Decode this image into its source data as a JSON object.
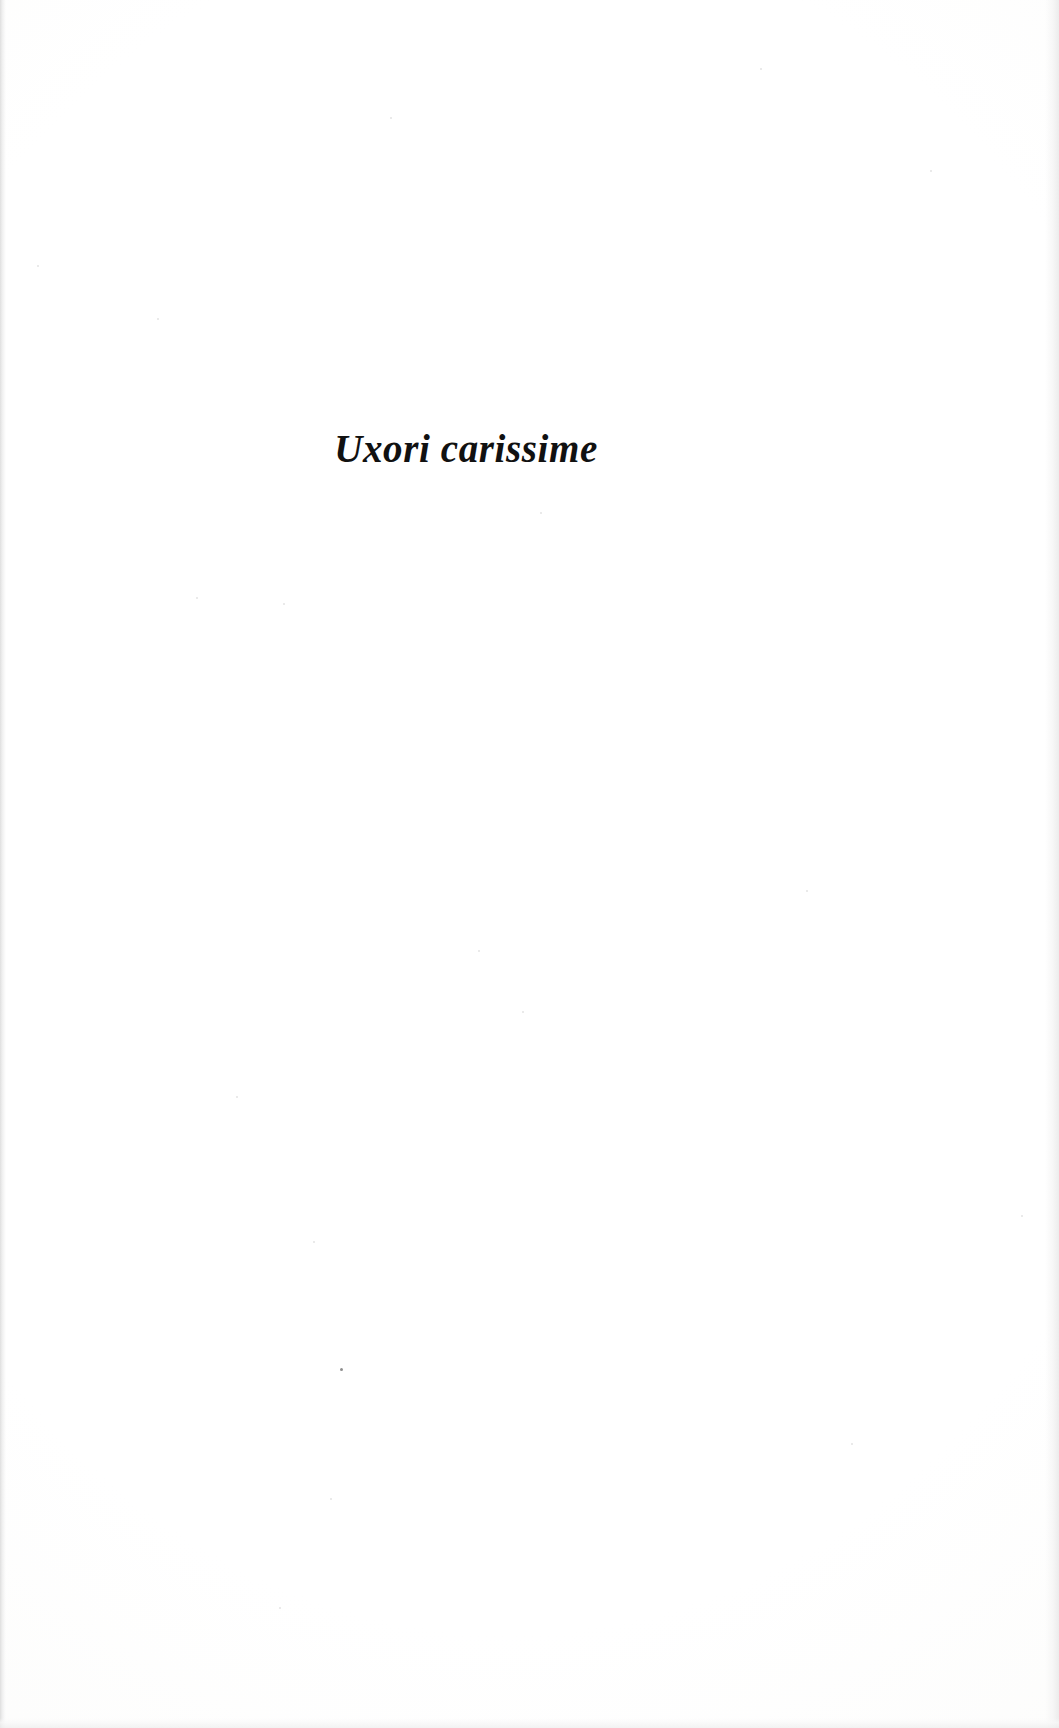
{
  "page": {
    "kind": "book-dedication-page",
    "width": 1059,
    "height": 1728,
    "paper_color": "#fdfdfd",
    "ink_color": "#111111"
  },
  "dedication": {
    "text": "Uxori carissime",
    "language": "Latin",
    "style": "bold-italic-serif",
    "alignment": "center"
  },
  "artifacts": {
    "left_edge_band": "grey scan edge",
    "right_edge_band": "grey scan falloff",
    "bottom_edge_band": "grey trim shadow",
    "specks": [
      {
        "x": 340,
        "y": 1368,
        "size": 3,
        "tone": "dark"
      },
      {
        "x": 930,
        "y": 170,
        "size": 2,
        "tone": "faint"
      },
      {
        "x": 760,
        "y": 68,
        "size": 2,
        "tone": "faint"
      },
      {
        "x": 390,
        "y": 117,
        "size": 2,
        "tone": "faint"
      },
      {
        "x": 37,
        "y": 265,
        "size": 2,
        "tone": "faint"
      },
      {
        "x": 157,
        "y": 318,
        "size": 2,
        "tone": "faint"
      },
      {
        "x": 283,
        "y": 603,
        "size": 2,
        "tone": "faint"
      },
      {
        "x": 196,
        "y": 597,
        "size": 2,
        "tone": "faint"
      },
      {
        "x": 540,
        "y": 512,
        "size": 2,
        "tone": "faint"
      },
      {
        "x": 522,
        "y": 1011,
        "size": 2,
        "tone": "faint"
      },
      {
        "x": 236,
        "y": 1096,
        "size": 2,
        "tone": "faint"
      },
      {
        "x": 478,
        "y": 950,
        "size": 2,
        "tone": "faint"
      },
      {
        "x": 806,
        "y": 890,
        "size": 2,
        "tone": "faint"
      },
      {
        "x": 313,
        "y": 1241,
        "size": 2,
        "tone": "faint"
      },
      {
        "x": 851,
        "y": 1443,
        "size": 2,
        "tone": "faint"
      },
      {
        "x": 330,
        "y": 1498,
        "size": 2,
        "tone": "faint"
      },
      {
        "x": 279,
        "y": 1607,
        "size": 2,
        "tone": "faint"
      },
      {
        "x": 1021,
        "y": 1215,
        "size": 2,
        "tone": "faint"
      }
    ]
  }
}
